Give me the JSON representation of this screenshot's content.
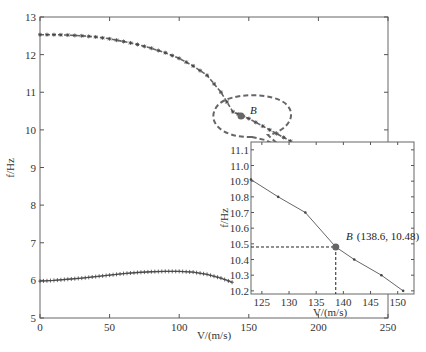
{
  "chart_data": [
    {
      "type": "line",
      "title": "",
      "xlabel": "V/(m/s)",
      "ylabel": "f/Hz",
      "xlim": [
        0,
        250
      ],
      "ylim": [
        5,
        13
      ],
      "xticks": [
        0,
        50,
        100,
        150,
        200,
        250
      ],
      "yticks": [
        5,
        6,
        7,
        8,
        9,
        10,
        11,
        12,
        13
      ],
      "grid": false,
      "series": [
        {
          "name": "mode-upper",
          "marker": "*",
          "x": [
            0,
            10,
            20,
            30,
            40,
            50,
            60,
            70,
            80,
            90,
            100,
            110,
            120,
            130,
            138.6,
            150,
            160,
            170,
            180
          ],
          "values": [
            12.53,
            12.53,
            12.52,
            12.5,
            12.47,
            12.42,
            12.35,
            12.27,
            12.17,
            12.05,
            11.9,
            11.7,
            11.45,
            11.0,
            10.48,
            10.3,
            10.1,
            9.9,
            9.7
          ]
        },
        {
          "name": "mode-lower",
          "marker": "+",
          "x": [
            0,
            10,
            20,
            30,
            40,
            50,
            60,
            70,
            80,
            90,
            100,
            110,
            120,
            130,
            138
          ],
          "values": [
            5.98,
            6.0,
            6.03,
            6.06,
            6.1,
            6.14,
            6.18,
            6.21,
            6.23,
            6.24,
            6.24,
            6.22,
            6.16,
            6.06,
            5.95
          ]
        }
      ],
      "annotations": [
        {
          "label": "B",
          "x": 138.6,
          "y": 10.48,
          "shape": "dashed-ellipse-callout"
        }
      ]
    },
    {
      "type": "line",
      "title": "inset zoom",
      "xlabel": "V/(m/s)",
      "ylabel": "f/Hz",
      "xlim": [
        123,
        153
      ],
      "ylim": [
        10.18,
        11.15
      ],
      "xticks": [
        125,
        130,
        135,
        140,
        145,
        150
      ],
      "yticks": [
        10.2,
        10.3,
        10.4,
        10.5,
        10.6,
        10.7,
        10.8,
        10.9,
        11.0,
        11.1
      ],
      "grid": false,
      "series": [
        {
          "name": "mode-upper-zoom",
          "marker": "dot",
          "x": [
            123,
            128,
            133,
            138.6,
            142,
            147,
            151
          ],
          "values": [
            10.91,
            10.8,
            10.7,
            10.48,
            10.4,
            10.3,
            10.2
          ]
        }
      ],
      "annotations": [
        {
          "label": "B (138.6, 10.48)",
          "x": 138.6,
          "y": 10.48,
          "guide_lines": "dashed"
        }
      ]
    }
  ],
  "main": {
    "xlabel": "V/(m/s)",
    "ylabel": "f/Hz",
    "xticks": [
      "0",
      "50",
      "100",
      "150",
      "200",
      "250"
    ],
    "yticks": [
      "5",
      "6",
      "7",
      "8",
      "9",
      "10",
      "11",
      "12",
      "13"
    ],
    "point_label": "B"
  },
  "inset": {
    "xlabel": "V/(m/s)",
    "ylabel": "f/Hz",
    "xticks": [
      "125",
      "130",
      "135",
      "140",
      "145",
      "150"
    ],
    "yticks": [
      "10.2",
      "10.3",
      "10.4",
      "10.5",
      "10.6",
      "10.7",
      "10.8",
      "10.9",
      "11.0",
      "11.1"
    ],
    "point_label": "B",
    "point_coords": "(138.6, 10.48)"
  },
  "colors": {
    "axis": "#555555",
    "curve": "#666666",
    "marker": "#444444",
    "point": "#666666"
  }
}
